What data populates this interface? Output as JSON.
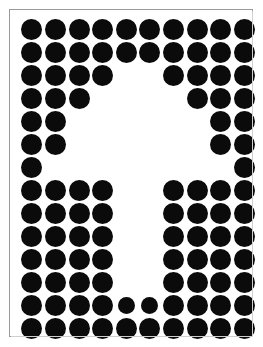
{
  "figure": {
    "title": "Dot matrix negative-space figure",
    "shape_name": "upward-arrow-negative-space",
    "background_color": "#ffffff",
    "dot_color": "#0b0b0b",
    "frame_color": "#9a9a9a",
    "frame_shadow_color": "#cfcfcf"
  },
  "canvas": {
    "width": 263,
    "height": 347,
    "frame_left": 9,
    "frame_top": 9,
    "frame_width": 244,
    "frame_height": 328
  },
  "grid": {
    "columns": 10,
    "rows": 14,
    "cell_width": 23.6,
    "cell_height": 23.0,
    "origin_x": 10,
    "origin_y": 8,
    "dot_diameter": 21,
    "dot_diameter_small": 17,
    "total_cells": 140,
    "filled_cells": 108,
    "empty_cells": 32
  },
  "chart_data": {
    "type": "heatmap",
    "title": "Dot matrix negative-space figure",
    "xlabel": "column",
    "ylabel": "row",
    "categories_x": [
      "1",
      "2",
      "3",
      "4",
      "5",
      "6",
      "7",
      "8",
      "9",
      "10"
    ],
    "categories_y": [
      "1",
      "2",
      "3",
      "4",
      "5",
      "6",
      "7",
      "8",
      "9",
      "10",
      "11",
      "12",
      "13",
      "14"
    ],
    "legend": [
      "1 = black dot",
      "0 = empty (white)"
    ],
    "grid": false,
    "values": [
      [
        1,
        1,
        1,
        1,
        1,
        1,
        1,
        1,
        1,
        1
      ],
      [
        1,
        1,
        1,
        1,
        1,
        1,
        1,
        1,
        1,
        1
      ],
      [
        1,
        1,
        1,
        1,
        0,
        0,
        1,
        1,
        1,
        1
      ],
      [
        1,
        1,
        1,
        0,
        0,
        0,
        0,
        1,
        1,
        1
      ],
      [
        1,
        1,
        0,
        0,
        0,
        0,
        0,
        0,
        1,
        1
      ],
      [
        1,
        1,
        0,
        0,
        0,
        0,
        0,
        0,
        1,
        1
      ],
      [
        1,
        0,
        0,
        0,
        0,
        0,
        0,
        0,
        0,
        1
      ],
      [
        1,
        1,
        1,
        1,
        0,
        0,
        1,
        1,
        1,
        1
      ],
      [
        1,
        1,
        1,
        1,
        0,
        0,
        1,
        1,
        1,
        1
      ],
      [
        1,
        1,
        1,
        1,
        0,
        0,
        1,
        1,
        1,
        1
      ],
      [
        1,
        1,
        1,
        1,
        0,
        0,
        1,
        1,
        1,
        1
      ],
      [
        1,
        1,
        1,
        1,
        0,
        0,
        1,
        1,
        1,
        1
      ],
      [
        1,
        1,
        1,
        1,
        1,
        1,
        1,
        1,
        1,
        1
      ],
      [
        1,
        1,
        1,
        1,
        1,
        1,
        1,
        1,
        1,
        1
      ]
    ],
    "small_dots": [
      [
        13,
        5
      ],
      [
        13,
        6
      ]
    ],
    "row_counts": [
      10,
      10,
      8,
      6,
      4,
      4,
      2,
      8,
      8,
      8,
      8,
      8,
      10,
      10
    ]
  }
}
